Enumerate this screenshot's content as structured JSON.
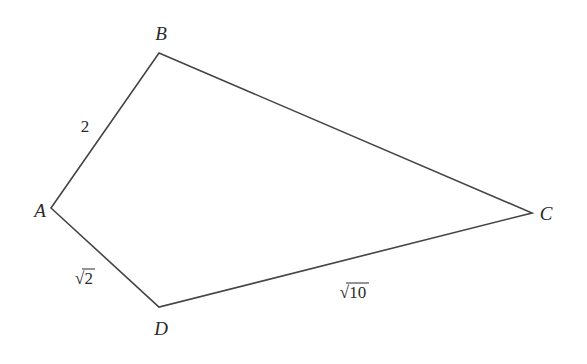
{
  "diagram": {
    "type": "quadrilateral",
    "vertices": [
      {
        "name": "A",
        "x": 51,
        "y": 208,
        "label_x": 40,
        "label_y": 217
      },
      {
        "name": "B",
        "x": 159,
        "y": 53,
        "label_x": 161,
        "label_y": 40
      },
      {
        "name": "C",
        "x": 532,
        "y": 213,
        "label_x": 546,
        "label_y": 220
      },
      {
        "name": "D",
        "x": 159,
        "y": 307,
        "label_x": 161,
        "label_y": 335
      }
    ],
    "edges": [
      {
        "from": "A",
        "to": "B",
        "label": "2",
        "label_x": 85,
        "label_y": 132
      },
      {
        "from": "B",
        "to": "C",
        "label": ""
      },
      {
        "from": "C",
        "to": "D",
        "label": "√10",
        "label_x": 338,
        "label_y": 298
      },
      {
        "from": "D",
        "to": "A",
        "label": "√2",
        "label_x": 72,
        "label_y": 284
      }
    ],
    "stroke_color": "#444444"
  }
}
